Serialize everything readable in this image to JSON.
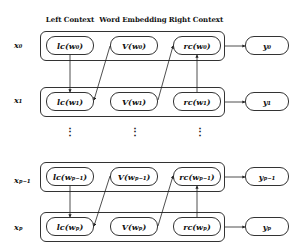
{
  "headers": {
    "left_context": "Left Context",
    "word_embedding": "Word Embedding",
    "right_context": "Right Context"
  },
  "rows": [
    {
      "x": "x₀",
      "lc": "lc(w₀)",
      "v": "V(w₀)",
      "rc": "rc(w₀)",
      "y": "y₀"
    },
    {
      "x": "x₁",
      "lc": "lc(w₁)",
      "v": "V(w₁)",
      "rc": "rc(w₁)",
      "y": "y₁"
    },
    {
      "x": "xₚ₋₁",
      "lc": "lc(wₚ₋₁)",
      "v": "V(wₚ₋₁)",
      "rc": "rc(wₚ₋₁)",
      "y": "yₚ₋₁"
    },
    {
      "x": "xₚ",
      "lc": "lc(wₚ)",
      "v": "V(wₚ)",
      "rc": "rc(wₚ)",
      "y": "yₚ"
    }
  ],
  "ellipsis": "⋮"
}
